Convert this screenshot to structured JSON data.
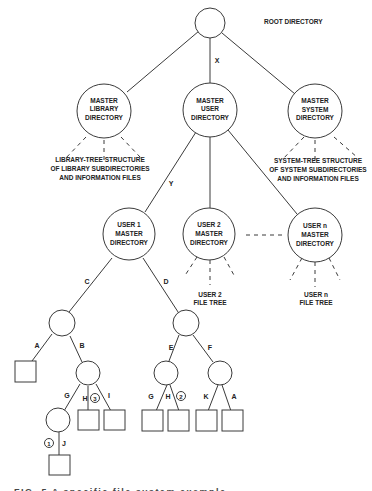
{
  "root": {
    "label": "ROOT DIRECTORY"
  },
  "masters": {
    "library": {
      "lines": [
        "MASTER",
        "LIBRARY",
        "DIRECTORY"
      ],
      "subtree": [
        "LIBRARY-TREE STRUCTURE",
        "OF LIBRARY SUBDIRECTORIES",
        "AND INFORMATION FILES"
      ]
    },
    "user": {
      "lines": [
        "MASTER",
        "USER",
        "DIRECTORY"
      ]
    },
    "system": {
      "lines": [
        "MASTER",
        "SYSTEM",
        "DIRECTORY"
      ],
      "subtree": [
        "SYSTEM-TREE STRUCTURE",
        "OF SYSTEM SUBDIRECTORIES",
        "AND INFORMATION FILES"
      ]
    }
  },
  "users": {
    "user1": {
      "lines": [
        "USER 1",
        "MASTER",
        "DIRECTORY"
      ]
    },
    "user2": {
      "lines": [
        "USER 2",
        "MASTER",
        "DIRECTORY"
      ],
      "subtree": [
        "USER 2",
        "FILE TREE"
      ]
    },
    "usern": {
      "lines": [
        "USER n",
        "MASTER",
        "DIRECTORY"
      ],
      "subtree": [
        "USER n",
        "FILE TREE"
      ]
    }
  },
  "edge_labels": {
    "x": "X",
    "y": "Y",
    "c": "C",
    "d": "D",
    "a1": "A",
    "b": "B",
    "g1": "G",
    "h1": "H",
    "i": "I",
    "j": "J",
    "e": "E",
    "f": "F",
    "g2": "G",
    "h2": "H",
    "k": "K",
    "a2": "A"
  },
  "markers": {
    "m1": "1",
    "m2": "2",
    "m3": "3"
  },
  "caption": "FIG. 5  A specific file system example"
}
